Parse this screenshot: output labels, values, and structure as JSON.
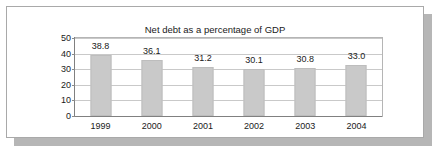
{
  "panel": {
    "background_color": "#ffffff",
    "border_color": "#a9a9a9",
    "shadow_color": "#b6b6b6"
  },
  "chart_data": {
    "type": "bar",
    "title": "Net debt as a percentage of GDP",
    "xlabel": "",
    "ylabel": "",
    "categories": [
      "1999",
      "2000",
      "2001",
      "2002",
      "2003",
      "2004"
    ],
    "values": [
      38.8,
      36.1,
      31.2,
      30.1,
      30.8,
      33.0
    ],
    "data_labels": [
      "38.8",
      "36.1",
      "31.2",
      "30.1",
      "30.8",
      "33.0"
    ],
    "yticks": [
      50,
      40,
      30,
      20,
      10,
      0
    ],
    "ytick_labels": [
      "50",
      "40",
      "30",
      "20",
      "10",
      "0"
    ],
    "ylim": [
      0,
      50
    ],
    "grid": true,
    "legend": false,
    "bar_color": "#c9c9c9",
    "bar_edge_color": "#bdbdbd",
    "gridline_color": "#c9c9c9",
    "axis_color": "#808080"
  }
}
